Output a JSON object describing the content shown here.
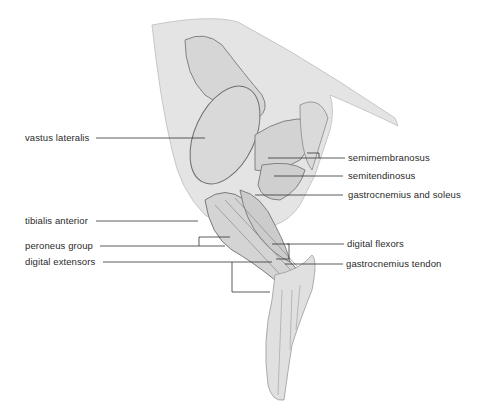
{
  "figure": {
    "labels_left": [
      {
        "text": "vastus lateralis"
      },
      {
        "text": "tibialis anterior"
      },
      {
        "text": "peroneus group"
      },
      {
        "text": "digital extensors"
      }
    ],
    "labels_right": [
      {
        "text": "semimembranosus"
      },
      {
        "text": "semitendinosus"
      },
      {
        "text": "gastrocnemius and soleus"
      },
      {
        "text": "digital flexors"
      },
      {
        "text": "gastrocnemius tendon"
      }
    ],
    "colors": {
      "skin": "#e6e6e6",
      "muscle": "#d8d8d8",
      "outline": "#6a6a6a",
      "leader": "#333333"
    }
  }
}
